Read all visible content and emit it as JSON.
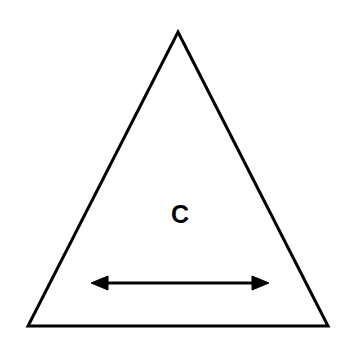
{
  "figure": {
    "background_color": "#ffffff",
    "stroke_color": "#000000",
    "width": 348,
    "height": 348,
    "triangle": {
      "name": "isosceles-triangle",
      "fill": "#ffffff",
      "stroke": "#000000",
      "stroke_width": 3,
      "points": "178,32 328,326 28,326",
      "apex": {
        "x": 178,
        "y": 32
      },
      "bottom_left": {
        "x": 28,
        "y": 326
      },
      "bottom_right": {
        "x": 328,
        "y": 326
      }
    },
    "label": {
      "text": "C",
      "x": 180,
      "y": 223,
      "font_size": 25,
      "font_weight": "bold",
      "color": "#000000"
    },
    "arrow": {
      "name": "double-headed-arrow",
      "orientation": "horizontal",
      "y": 283,
      "x_start": 91,
      "x_end": 269,
      "shaft_stroke_width": 3,
      "head_length": 17,
      "head_half_height": 7,
      "color": "#000000",
      "shaft_path": "M 105 283 L 255 283",
      "left_head_points": "91,283 108,276 108,290",
      "right_head_points": "269,283 252,276 252,290"
    }
  }
}
